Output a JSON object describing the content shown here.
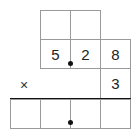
{
  "problem": {
    "type": "decimal multiplication layout",
    "multiplicand": {
      "digits": [
        "5",
        "2",
        "8"
      ],
      "decimal_after_index": 0
    },
    "multiplier": {
      "digits": [
        "3"
      ]
    },
    "operator": "×",
    "carry_row": [
      "",
      ""
    ],
    "answer_row": [
      "",
      "",
      "",
      ""
    ],
    "answer_decimal_between": [
      1,
      2
    ]
  }
}
